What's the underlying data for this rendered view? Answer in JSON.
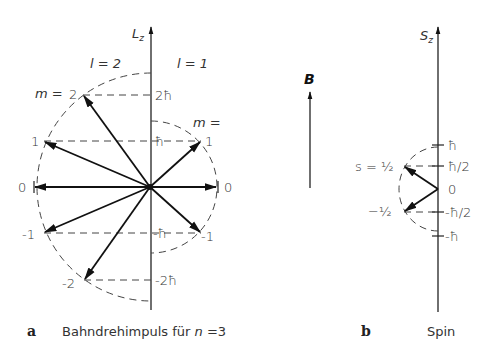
{
  "panel_a": {
    "letter": "a",
    "caption_prefix": "Bahndrehimpuls für ",
    "caption_var": "n",
    "caption_suffix": " =3",
    "axis_label": "L",
    "axis_sub": "z",
    "l2_label": "l = 2",
    "l1_label": "l = 1",
    "m_label_l2": "m =",
    "m_label_l1": "m =",
    "m_l2": [
      "2",
      "1",
      "0",
      "-1",
      "-2"
    ],
    "m_l1": [
      "1",
      "0",
      "-1"
    ],
    "ticks": [
      "2ħ",
      "ħ",
      "-ħ",
      "-2ħ"
    ]
  },
  "field": {
    "label": "B"
  },
  "panel_b": {
    "letter": "b",
    "caption": "Spin",
    "axis_label": "S",
    "axis_sub": "z",
    "s_label": "s = ½",
    "minus_label": "−½",
    "origin_label": "0",
    "ticks": [
      "ħ",
      "ħ/2",
      "-ħ/2",
      "-ħ"
    ]
  }
}
